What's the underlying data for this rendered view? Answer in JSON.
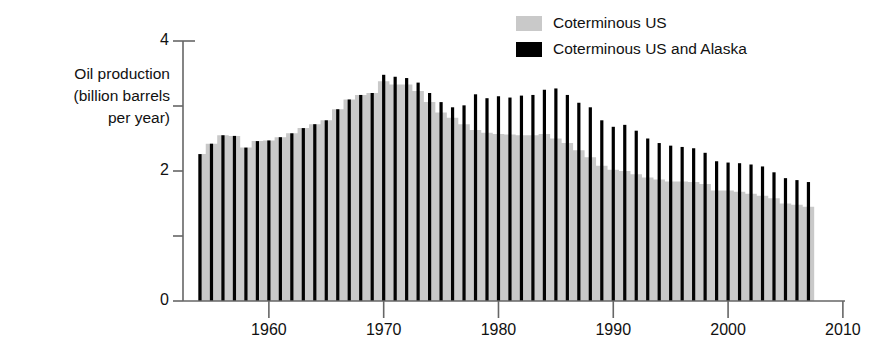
{
  "chart_data": {
    "type": "area",
    "title": "",
    "xlabel": "",
    "ylabel": "Oil production\n(billion barrels\nper year)",
    "xlim": [
      1953.0,
      2011.0
    ],
    "ylim": [
      0,
      4
    ],
    "grid": false,
    "legend_position": "top-right",
    "y_ticks": [
      0,
      1,
      2,
      3,
      4
    ],
    "y_tick_labels": [
      "0",
      "",
      "2",
      "",
      "4"
    ],
    "x_ticks": [
      1960,
      1970,
      1980,
      1990,
      2000,
      2010
    ],
    "x_tick_labels": [
      "1960",
      "1970",
      "1980",
      "1990",
      "2000",
      "2010"
    ],
    "colors": {
      "coterminous_us": "#c9c9c9",
      "coterminous_us_and_alaska": "#000000",
      "axis": "#666666",
      "text": "#111111"
    },
    "x": [
      1954,
      1955,
      1956,
      1957,
      1958,
      1959,
      1960,
      1961,
      1962,
      1963,
      1964,
      1965,
      1966,
      1967,
      1968,
      1969,
      1970,
      1971,
      1972,
      1973,
      1974,
      1975,
      1976,
      1977,
      1978,
      1979,
      1980,
      1981,
      1982,
      1983,
      1984,
      1985,
      1986,
      1987,
      1988,
      1989,
      1990,
      1991,
      1992,
      1993,
      1994,
      1995,
      1996,
      1997,
      1998,
      1999,
      2000,
      2001,
      2002,
      2003,
      2004,
      2005,
      2006,
      2007
    ],
    "series": [
      {
        "name": "Coterminous US",
        "values": [
          2.26,
          2.42,
          2.55,
          2.54,
          2.36,
          2.46,
          2.47,
          2.52,
          2.58,
          2.66,
          2.72,
          2.78,
          2.95,
          3.1,
          3.17,
          3.2,
          3.38,
          3.33,
          3.33,
          3.23,
          3.06,
          2.9,
          2.82,
          2.72,
          2.63,
          2.59,
          2.57,
          2.56,
          2.55,
          2.55,
          2.57,
          2.5,
          2.43,
          2.32,
          2.21,
          2.08,
          2.02,
          2.0,
          1.95,
          1.9,
          1.87,
          1.84,
          1.84,
          1.83,
          1.8,
          1.7,
          1.7,
          1.68,
          1.65,
          1.62,
          1.58,
          1.5,
          1.48,
          1.45
        ]
      },
      {
        "name": "Coterminous US and Alaska",
        "values": [
          2.26,
          2.42,
          2.55,
          2.54,
          2.36,
          2.46,
          2.47,
          2.52,
          2.58,
          2.66,
          2.72,
          2.78,
          2.95,
          3.1,
          3.17,
          3.2,
          3.48,
          3.45,
          3.43,
          3.36,
          3.2,
          3.06,
          2.98,
          3.01,
          3.18,
          3.12,
          3.15,
          3.13,
          3.16,
          3.17,
          3.25,
          3.27,
          3.17,
          3.05,
          2.98,
          2.78,
          2.68,
          2.71,
          2.62,
          2.5,
          2.43,
          2.39,
          2.37,
          2.35,
          2.28,
          2.15,
          2.13,
          2.12,
          2.1,
          2.07,
          1.98,
          1.89,
          1.86,
          1.83
        ]
      }
    ]
  },
  "legend": {
    "items": [
      {
        "label": "Coterminous US",
        "color": "#c9c9c9"
      },
      {
        "label": "Coterminous US and Alaska",
        "color": "#000000"
      }
    ]
  },
  "axis_label": {
    "line1": "Oil production",
    "line2": "(billion barrels",
    "line3": "per year)"
  }
}
